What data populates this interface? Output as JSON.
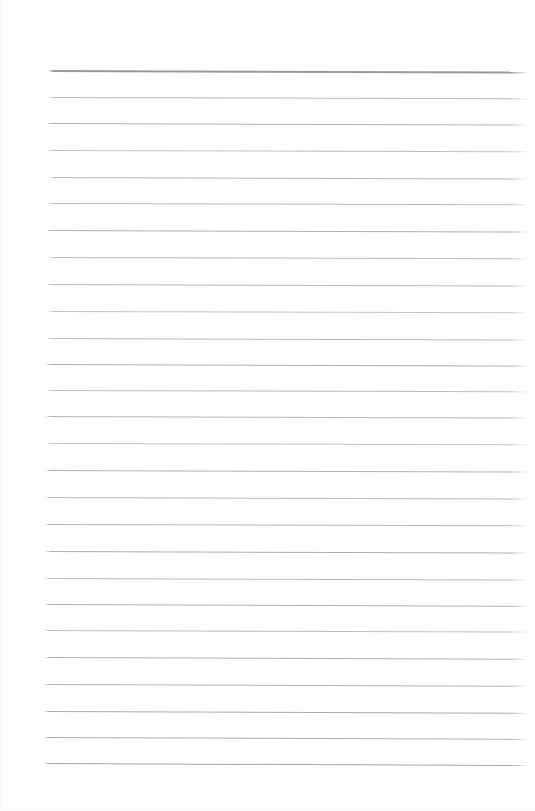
{
  "document": {
    "kind": "scanned-lined-paper",
    "title": "Blank Lined Notepad Page",
    "description": "Scan of an empty ruled writing pad sheet with no handwriting or printed text",
    "page_width": 535,
    "page_height": 811,
    "background_color": "#ffffff",
    "body_text": "",
    "visible_text_count": 0
  },
  "ruling": {
    "style": "wide-ruled horizontal lines",
    "line_count": 27,
    "line_color": "#b9bbbe",
    "header_rule_color": "#9b9ea2",
    "first_line_y": 70,
    "last_line_y": 763,
    "line_spacing": 26.65,
    "line_left_x": 45,
    "line_right_x": 529,
    "line_thickness": 1,
    "skew_degrees": 0.18,
    "lines": [
      {
        "index": 0,
        "y": 70,
        "x_start": 48,
        "x_end": 529,
        "tilt": 1.6,
        "weight": 1.7,
        "color": "#97999d",
        "opacity": 1.0
      },
      {
        "index": 1,
        "y": 97,
        "x_start": 47,
        "x_end": 529,
        "tilt": 1.4,
        "weight": 1.0,
        "color": "#b4b6b9",
        "opacity": 0.95
      },
      {
        "index": 2,
        "y": 123,
        "x_start": 46,
        "x_end": 529,
        "tilt": 1.5,
        "weight": 1.1,
        "color": "#adafb3",
        "opacity": 0.97
      },
      {
        "index": 3,
        "y": 150,
        "x_start": 47,
        "x_end": 529,
        "tilt": 1.3,
        "weight": 1.0,
        "color": "#b8babd",
        "opacity": 0.92
      },
      {
        "index": 4,
        "y": 177,
        "x_start": 48,
        "x_end": 529,
        "tilt": 1.5,
        "weight": 1.0,
        "color": "#b0b2b6",
        "opacity": 0.95
      },
      {
        "index": 5,
        "y": 203,
        "x_start": 47,
        "x_end": 529,
        "tilt": 1.4,
        "weight": 1.0,
        "color": "#b6b8bb",
        "opacity": 0.93
      },
      {
        "index": 6,
        "y": 230,
        "x_start": 46,
        "x_end": 529,
        "tilt": 1.6,
        "weight": 1.1,
        "color": "#aaacb0",
        "opacity": 0.97
      },
      {
        "index": 7,
        "y": 257,
        "x_start": 47,
        "x_end": 529,
        "tilt": 1.4,
        "weight": 1.0,
        "color": "#b5b7ba",
        "opacity": 0.94
      },
      {
        "index": 8,
        "y": 284,
        "x_start": 46,
        "x_end": 529,
        "tilt": 1.5,
        "weight": 1.0,
        "color": "#b1b3b7",
        "opacity": 0.95
      },
      {
        "index": 9,
        "y": 311,
        "x_start": 47,
        "x_end": 529,
        "tilt": 1.3,
        "weight": 1.0,
        "color": "#babcbf",
        "opacity": 0.91
      },
      {
        "index": 10,
        "y": 338,
        "x_start": 46,
        "x_end": 529,
        "tilt": 1.5,
        "weight": 1.0,
        "color": "#b3b5b9",
        "opacity": 0.94
      },
      {
        "index": 11,
        "y": 364,
        "x_start": 45,
        "x_end": 529,
        "tilt": 1.6,
        "weight": 1.1,
        "color": "#a9abaf",
        "opacity": 0.97
      },
      {
        "index": 12,
        "y": 390,
        "x_start": 46,
        "x_end": 529,
        "tilt": 1.4,
        "weight": 1.0,
        "color": "#b6b8bc",
        "opacity": 0.93
      },
      {
        "index": 13,
        "y": 416,
        "x_start": 45,
        "x_end": 529,
        "tilt": 1.5,
        "weight": 1.0,
        "color": "#b2b4b8",
        "opacity": 0.95
      },
      {
        "index": 14,
        "y": 443,
        "x_start": 46,
        "x_end": 529,
        "tilt": 1.4,
        "weight": 1.0,
        "color": "#babcbf",
        "opacity": 0.9
      },
      {
        "index": 15,
        "y": 470,
        "x_start": 45,
        "x_end": 529,
        "tilt": 1.6,
        "weight": 1.1,
        "color": "#acaeb2",
        "opacity": 0.96
      },
      {
        "index": 16,
        "y": 497,
        "x_start": 45,
        "x_end": 529,
        "tilt": 1.5,
        "weight": 1.0,
        "color": "#b4b6ba",
        "opacity": 0.94
      },
      {
        "index": 17,
        "y": 524,
        "x_start": 44,
        "x_end": 529,
        "tilt": 1.4,
        "weight": 1.0,
        "color": "#b0b2b6",
        "opacity": 0.95
      },
      {
        "index": 18,
        "y": 551,
        "x_start": 45,
        "x_end": 529,
        "tilt": 1.6,
        "weight": 1.1,
        "color": "#a8aaae",
        "opacity": 0.97
      },
      {
        "index": 19,
        "y": 578,
        "x_start": 44,
        "x_end": 529,
        "tilt": 1.5,
        "weight": 1.0,
        "color": "#b5b7bb",
        "opacity": 0.93
      },
      {
        "index": 20,
        "y": 604,
        "x_start": 44,
        "x_end": 529,
        "tilt": 1.7,
        "weight": 1.1,
        "color": "#aaacb0",
        "opacity": 0.97
      },
      {
        "index": 21,
        "y": 630,
        "x_start": 43,
        "x_end": 529,
        "tilt": 1.5,
        "weight": 1.0,
        "color": "#b7b9bc",
        "opacity": 0.92
      },
      {
        "index": 22,
        "y": 657,
        "x_start": 44,
        "x_end": 529,
        "tilt": 1.8,
        "weight": 1.1,
        "color": "#a9abaf",
        "opacity": 0.97
      },
      {
        "index": 23,
        "y": 684,
        "x_start": 43,
        "x_end": 529,
        "tilt": 1.7,
        "weight": 1.1,
        "color": "#acaeb2",
        "opacity": 0.96
      },
      {
        "index": 24,
        "y": 711,
        "x_start": 43,
        "x_end": 529,
        "tilt": 1.8,
        "weight": 1.1,
        "color": "#a6a8ac",
        "opacity": 0.98
      },
      {
        "index": 25,
        "y": 737,
        "x_start": 43,
        "x_end": 529,
        "tilt": 1.9,
        "weight": 1.1,
        "color": "#a9abaf",
        "opacity": 0.97
      },
      {
        "index": 26,
        "y": 763,
        "x_start": 43,
        "x_end": 529,
        "tilt": 2.0,
        "weight": 1.2,
        "color": "#a3a5a9",
        "opacity": 0.98
      }
    ]
  },
  "margins": {
    "top_label": "top margin",
    "bottom_label": "bottom margin",
    "left_label": "left margin",
    "right_label": "right margin"
  }
}
